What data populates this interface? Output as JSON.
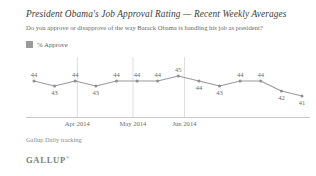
{
  "header": {
    "title": "President Obama's Job Approval Rating — Recent Weekly Averages",
    "subtitle": "Do you approve or disapprove of the way Barack Obama is handling his job as president?"
  },
  "legend": {
    "label": "% Approve",
    "swatch_color": "#9a9a9a"
  },
  "footer": {
    "source": "Gallup Daily tracking",
    "logo": "GALLUP",
    "logo_mark": "®"
  },
  "colors": {
    "line": "#9a9a9a",
    "marker": "#8f8f8f",
    "gridline": "#d7d7d7",
    "axis": "#c9c9c9",
    "title_text": "#3b3b3b",
    "label_text": "#6b6b6b"
  },
  "chart_data": {
    "type": "line",
    "title": "President Obama's Job Approval Rating — Recent Weekly Averages",
    "subtitle": "Do you approve or disapprove of the way Barack Obama is handling his job as president?",
    "xlabel": "",
    "ylabel": "",
    "ylim": [
      40,
      46
    ],
    "grid": "vertical-only",
    "legend_position": "top-left",
    "series": [
      {
        "name": "% Approve",
        "values": [
          44,
          43,
          44,
          43,
          44,
          44,
          44,
          45,
          44,
          43,
          44,
          44,
          42,
          41
        ],
        "label_positions": [
          "above",
          "below",
          "above",
          "below",
          "above",
          "above",
          "above",
          "above",
          "below",
          "below",
          "above",
          "above",
          "below",
          "below"
        ]
      }
    ],
    "x_tick_labels": [
      "Apr 2014",
      "May 2014",
      "Jun 2014"
    ],
    "x_tick_positions": [
      2.1,
      4.8,
      7.3
    ],
    "point_count": 14,
    "source": "Gallup Daily tracking"
  }
}
